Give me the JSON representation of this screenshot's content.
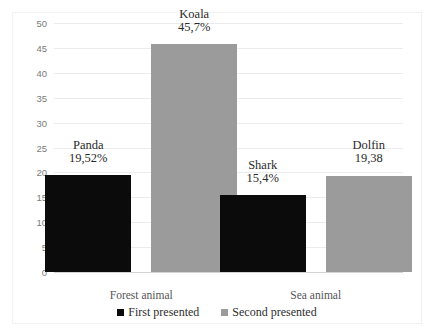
{
  "clipped_caption": "…cut-off text line above figure…",
  "chart_data": {
    "type": "bar",
    "title": "",
    "xlabel": "",
    "ylabel": "",
    "ylim": [
      0,
      50
    ],
    "ytick_step": 5,
    "yticks": [
      "50",
      "45",
      "40",
      "35",
      "30",
      "25",
      "20",
      "15",
      "10",
      "5",
      "0"
    ],
    "grid": true,
    "legend_position": "bottom-center",
    "categories": [
      "Forest animal",
      "Sea animal"
    ],
    "series": [
      {
        "name": "First presented",
        "color": "#0b0b0b",
        "values": [
          19.52,
          15.4
        ],
        "point_names": [
          "Panda",
          "Shark"
        ],
        "point_value_labels": [
          "19,52%",
          "15,4%"
        ]
      },
      {
        "name": "Second presented",
        "color": "#9b9b9b",
        "values": [
          45.7,
          19.38
        ],
        "point_names": [
          "Koala",
          "Dolfin"
        ],
        "point_value_labels": [
          "45,7%",
          "19,38"
        ]
      }
    ]
  }
}
